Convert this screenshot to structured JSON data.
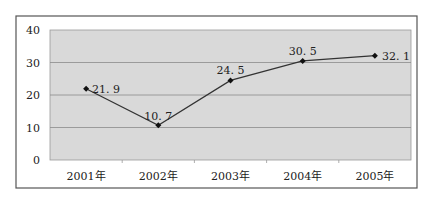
{
  "chart_data": {
    "type": "line",
    "title": "",
    "xlabel": "",
    "ylabel": "",
    "categories": [
      "2001年",
      "2002年",
      "2003年",
      "2004年",
      "2005年"
    ],
    "series": [
      {
        "name": "",
        "values": [
          21.9,
          10.7,
          24.5,
          30.5,
          32.1
        ],
        "labels": [
          "21. 9",
          "10. 7",
          "24. 5",
          "30. 5",
          "32. 1"
        ]
      }
    ],
    "ylim": [
      0,
      40
    ],
    "yticks": [
      "0",
      "10",
      "20",
      "30",
      "40"
    ],
    "grid": true,
    "legend": "none",
    "colors": {
      "plot_bg": "#d9d9d9",
      "line": "#333333",
      "grid": "#8c8c8c",
      "frame": "#555555"
    }
  }
}
